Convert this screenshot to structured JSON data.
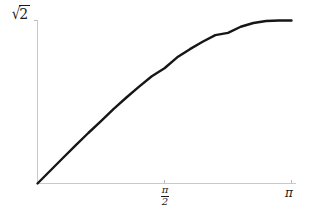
{
  "figure": {
    "name": "sine-like-curve-plot",
    "background_color": "#ffffff",
    "curve_color": "#161616",
    "axis_color": "#c9c9c9",
    "tick_color": "#b8b8b8",
    "text_color": "#1a1a1a"
  },
  "labels": {
    "y_max": "√2",
    "y_max_radical_sign": "√",
    "y_max_radicand": "2",
    "x_mid_numerator": "π",
    "x_mid_denominator": "2",
    "x_mid": "π/2",
    "x_max": "π"
  },
  "chart_data": {
    "type": "line",
    "title": "",
    "subtitle": "",
    "xlabel": "",
    "ylabel": "",
    "grid": false,
    "legend": "none",
    "series": [
      {
        "name": "curve",
        "expression": "sqrt(2)*sin(x/2)",
        "x": [
          0,
          0.15708,
          0.31416,
          0.47124,
          0.62832,
          0.7854,
          0.94248,
          1.09956,
          1.25664,
          1.41372,
          1.5708,
          1.72788,
          1.88496,
          2.04204,
          2.19911,
          2.35619,
          2.51327,
          2.67035,
          2.82743,
          2.98451,
          3.14159
        ],
        "y": [
          0.0,
          0.1108,
          0.2211,
          0.3303,
          0.4381,
          0.5412,
          0.6472,
          0.7462,
          0.8409,
          0.9306,
          1.0,
          1.0944,
          1.1657,
          1.2301,
          1.2871,
          1.3066,
          1.3601,
          1.3924,
          1.4097,
          1.4142,
          1.41421
        ]
      }
    ],
    "x_ticks": [
      {
        "value": 1.5708,
        "label": "π/2"
      },
      {
        "value": 3.14159,
        "label": "π"
      }
    ],
    "y_ticks": [
      {
        "value": 1.41421,
        "label": "√2"
      }
    ],
    "xlim": [
      0,
      3.3
    ],
    "ylim": [
      0,
      1.4142
    ],
    "axis_origin": {
      "x": 0,
      "y": 0
    }
  }
}
